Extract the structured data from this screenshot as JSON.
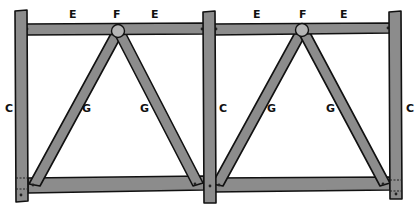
{
  "diagram": {
    "colors": {
      "wood": "#8c8c8c",
      "outline": "#111111",
      "hub": "#b5b5b5",
      "background": "#ffffff"
    },
    "labels": {
      "post_left": "C",
      "post_middle": "C",
      "post_right": "C",
      "rail_left_a": "E",
      "rail_left_b": "E",
      "rail_right_a": "E",
      "rail_right_b": "E",
      "hub_left": "F",
      "hub_right": "F",
      "brace_left_a": "G",
      "brace_left_b": "G",
      "brace_right_a": "G",
      "brace_right_b": "G"
    },
    "panels": [
      {
        "name": "left-panel",
        "top_rail": "E",
        "hub": "F",
        "braces": [
          "G",
          "G"
        ],
        "post": "C"
      },
      {
        "name": "right-panel",
        "top_rail": "E",
        "hub": "F",
        "braces": [
          "G",
          "G"
        ],
        "post": "C"
      }
    ]
  }
}
